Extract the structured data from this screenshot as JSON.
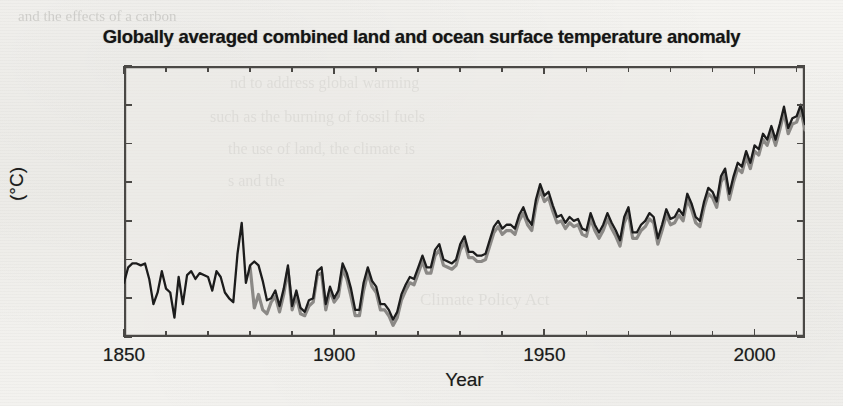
{
  "figure": {
    "title": "Globally averaged combined land and ocean surface temperature anomaly",
    "xlabel": "Year",
    "ylabel": "(°C)",
    "background_color": "#f2f1ee",
    "axis_color": "#4a4845"
  },
  "axes": {
    "x_ticks": [
      "1850",
      "1900",
      "1950",
      "2000"
    ],
    "y_ticks": [
      "0.4",
      "0.2",
      "0",
      "−0.2",
      "−0.4",
      "−0.6",
      "−0.8",
      "−1"
    ]
  },
  "ghost_text": {
    "lines": [
      "and the effects of a carbon",
      "nd to address global warming",
      "such as the burning of fossil fuels",
      "the use of land, the climate is",
      "s and the",
      "Climate Policy Act"
    ]
  },
  "chart_data": {
    "type": "line",
    "title": "Globally averaged combined land and ocean surface temperature anomaly",
    "xlabel": "Year",
    "ylabel": "(°C)",
    "xlim": [
      1850,
      2012
    ],
    "ylim": [
      -1,
      0.4
    ],
    "x_ticks": [
      1850,
      1900,
      1950,
      2000
    ],
    "x_minor_tick_step": 10,
    "y_ticks": [
      -1,
      -0.8,
      -0.6,
      -0.4,
      -0.2,
      0,
      0.2,
      0.4
    ],
    "grid": false,
    "legend": "none",
    "series": [
      {
        "name": "Annual average (black record)",
        "color": "#1c1c1c",
        "linewidth": 2.3,
        "x_start": 1850,
        "x_end": 2012,
        "values": [
          -0.72,
          -0.64,
          -0.62,
          -0.62,
          -0.63,
          -0.62,
          -0.7,
          -0.83,
          -0.77,
          -0.66,
          -0.75,
          -0.77,
          -0.9,
          -0.69,
          -0.83,
          -0.68,
          -0.66,
          -0.7,
          -0.67,
          -0.68,
          -0.69,
          -0.76,
          -0.66,
          -0.69,
          -0.77,
          -0.8,
          -0.82,
          -0.57,
          -0.41,
          -0.72,
          -0.63,
          -0.61,
          -0.63,
          -0.71,
          -0.81,
          -0.8,
          -0.76,
          -0.84,
          -0.75,
          -0.63,
          -0.84,
          -0.76,
          -0.85,
          -0.87,
          -0.81,
          -0.8,
          -0.66,
          -0.64,
          -0.83,
          -0.74,
          -0.8,
          -0.76,
          -0.62,
          -0.67,
          -0.75,
          -0.86,
          -0.86,
          -0.72,
          -0.64,
          -0.71,
          -0.74,
          -0.83,
          -0.83,
          -0.86,
          -0.91,
          -0.87,
          -0.78,
          -0.73,
          -0.69,
          -0.7,
          -0.64,
          -0.58,
          -0.64,
          -0.64,
          -0.55,
          -0.52,
          -0.6,
          -0.61,
          -0.62,
          -0.6,
          -0.52,
          -0.48,
          -0.56,
          -0.56,
          -0.58,
          -0.58,
          -0.57,
          -0.5,
          -0.43,
          -0.4,
          -0.44,
          -0.42,
          -0.42,
          -0.44,
          -0.37,
          -0.33,
          -0.39,
          -0.42,
          -0.29,
          -0.21,
          -0.27,
          -0.25,
          -0.32,
          -0.38,
          -0.37,
          -0.41,
          -0.38,
          -0.4,
          -0.39,
          -0.44,
          -0.45,
          -0.36,
          -0.42,
          -0.46,
          -0.42,
          -0.36,
          -0.41,
          -0.45,
          -0.5,
          -0.38,
          -0.33,
          -0.46,
          -0.46,
          -0.42,
          -0.4,
          -0.36,
          -0.38,
          -0.49,
          -0.42,
          -0.34,
          -0.39,
          -0.38,
          -0.34,
          -0.37,
          -0.26,
          -0.31,
          -0.38,
          -0.4,
          -0.3,
          -0.23,
          -0.25,
          -0.3,
          -0.17,
          -0.13,
          -0.26,
          -0.17,
          -0.1,
          -0.12,
          -0.04,
          -0.1,
          -0.01,
          -0.03,
          0.05,
          0.02,
          0.09,
          0.02,
          0.1,
          0.19,
          0.08,
          0.13,
          0.14,
          0.2,
          0.1
        ]
      },
      {
        "name": "Annual average (grey record)",
        "color": "#8b8986",
        "linewidth": 3.2,
        "x_start": 1880,
        "x_end": 2012,
        "values": [
          -0.64,
          -0.85,
          -0.78,
          -0.86,
          -0.88,
          -0.82,
          -0.79,
          -0.87,
          -0.78,
          -0.65,
          -0.86,
          -0.79,
          -0.88,
          -0.89,
          -0.84,
          -0.82,
          -0.68,
          -0.67,
          -0.86,
          -0.76,
          -0.82,
          -0.79,
          -0.65,
          -0.7,
          -0.79,
          -0.89,
          -0.89,
          -0.76,
          -0.67,
          -0.74,
          -0.77,
          -0.86,
          -0.86,
          -0.89,
          -0.94,
          -0.9,
          -0.81,
          -0.76,
          -0.72,
          -0.73,
          -0.67,
          -0.61,
          -0.67,
          -0.67,
          -0.58,
          -0.55,
          -0.63,
          -0.64,
          -0.65,
          -0.63,
          -0.55,
          -0.51,
          -0.59,
          -0.59,
          -0.61,
          -0.61,
          -0.6,
          -0.53,
          -0.46,
          -0.43,
          -0.47,
          -0.45,
          -0.45,
          -0.47,
          -0.4,
          -0.36,
          -0.42,
          -0.45,
          -0.32,
          -0.24,
          -0.3,
          -0.28,
          -0.35,
          -0.41,
          -0.4,
          -0.44,
          -0.41,
          -0.43,
          -0.42,
          -0.47,
          -0.48,
          -0.39,
          -0.45,
          -0.49,
          -0.45,
          -0.39,
          -0.44,
          -0.48,
          -0.53,
          -0.41,
          -0.36,
          -0.49,
          -0.49,
          -0.45,
          -0.43,
          -0.39,
          -0.41,
          -0.52,
          -0.45,
          -0.37,
          -0.42,
          -0.41,
          -0.37,
          -0.4,
          -0.29,
          -0.34,
          -0.41,
          -0.43,
          -0.33,
          -0.26,
          -0.28,
          -0.33,
          -0.2,
          -0.16,
          -0.29,
          -0.2,
          -0.13,
          -0.15,
          -0.07,
          -0.13,
          -0.04,
          -0.06,
          0.02,
          -0.01,
          0.06,
          -0.01,
          0.07,
          0.16,
          0.05,
          0.1,
          0.11,
          0.17,
          0.07
        ]
      }
    ]
  }
}
